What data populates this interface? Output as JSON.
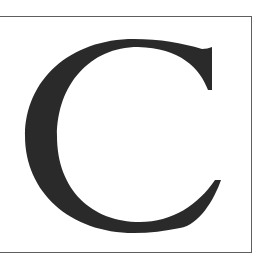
{
  "glyph": {
    "character": "C",
    "color": "#2a2a2a"
  },
  "frame": {
    "border_color": "#5e5e5e"
  }
}
